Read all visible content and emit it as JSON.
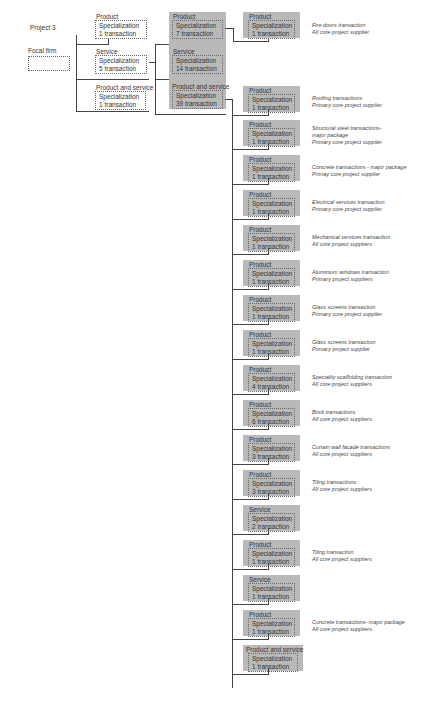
{
  "project_label": "Project 3",
  "focal_firm_label": "Focal firm",
  "level1": [
    {
      "type": "Product",
      "spec": "Specialization",
      "count": "1 transaction"
    },
    {
      "type": "Service",
      "spec": "Specialization",
      "count": "5 transaction"
    },
    {
      "type": "Product and service",
      "spec": "Specialization",
      "count": "1 transaction"
    }
  ],
  "level2": [
    {
      "type": "Product",
      "spec": "Specialization",
      "count": "7 transaction"
    },
    {
      "type": "Service",
      "spec": "Specialization",
      "count": "14 transaction"
    },
    {
      "type": "Product and service",
      "spec": "Specialization",
      "count": "39 transaction"
    }
  ],
  "level3": [
    {
      "type": "Product",
      "spec": "Specialization",
      "count": "1 transaction",
      "note1": "Fire doors transaction",
      "note2": "All core project supplier",
      "note3": ""
    },
    {
      "type": "Product",
      "spec": "Specialization",
      "count": "1 transaction",
      "note1": "Roofing transactions",
      "note2": "Primary core project supplier",
      "note3": ""
    },
    {
      "type": "Product",
      "spec": "Specialization",
      "count": "1 transaction",
      "note1": "Structural steel transactions-",
      "note2": "major package",
      "note3": "Primary core project supplier"
    },
    {
      "type": "Product",
      "spec": "Specialization",
      "count": "1 transaction",
      "note1": "Concrete transactions - major package",
      "note2": "Primay core project supplier",
      "note3": ""
    },
    {
      "type": "Product",
      "spec": "Specialization",
      "count": "1 transaction",
      "note1": "Electrical services transaction",
      "note2": "Primary core project supplier",
      "note3": ""
    },
    {
      "type": "Product",
      "spec": "Specialization",
      "count": "1 transaction",
      "note1": "Mechanical services transaction",
      "note2": "All core project suppliers",
      "note3": ""
    },
    {
      "type": "Product",
      "spec": "Specialization",
      "count": "1 transaction",
      "note1": "Aluminium windows transaction",
      "note2": "Primary project suppliers",
      "note3": ""
    },
    {
      "type": "Product",
      "spec": "Specialization",
      "count": "1 transaction",
      "note1": "Glass screens transaction",
      "note2": "Primary core project supplier",
      "note3": ""
    },
    {
      "type": "Product",
      "spec": "Specialization",
      "count": "1 transaction",
      "note1": "Glass screens transaction",
      "note2": "Primary project supplier",
      "note3": ""
    },
    {
      "type": "Product",
      "spec": "Specialization",
      "count": "4 transaction",
      "note1": "Speciality scaffolding transaction",
      "note2": "All core project suppliers",
      "note3": ""
    },
    {
      "type": "Product",
      "spec": "Specialization",
      "count": "6 transaction",
      "note1": "Brick transactions",
      "note2": "All core project suppliers",
      "note3": ""
    },
    {
      "type": "Product",
      "spec": "Specialization",
      "count": "3 transaction",
      "note1": "Curtain wall facade transactions",
      "note2": "All core project suppliers",
      "note3": ""
    },
    {
      "type": "Product",
      "spec": "Specialization",
      "count": "3 transaction",
      "note1": "Tiling transactions",
      "note2": "All core project suppliers",
      "note3": ""
    },
    {
      "type": "Service",
      "spec": "Specialization",
      "count": "2 transaction",
      "note1": "",
      "note2": "",
      "note3": ""
    },
    {
      "type": "Product",
      "spec": "Specialization",
      "count": "1 transaction",
      "note1": "Tiling transaction",
      "note2": "All core project suppliers",
      "note3": ""
    },
    {
      "type": "Service",
      "spec": "Specialization",
      "count": "1 transaction",
      "note1": "",
      "note2": "",
      "note3": ""
    },
    {
      "type": "Product",
      "spec": "Specialization",
      "count": "1 transaction",
      "note1": "Concrete transactions- major package",
      "note2": "All core project suppliers",
      "note3": ""
    },
    {
      "type": "Product and service",
      "spec": "Specialization",
      "count": "1 transaction",
      "note1": "",
      "note2": "",
      "note3": ""
    }
  ]
}
